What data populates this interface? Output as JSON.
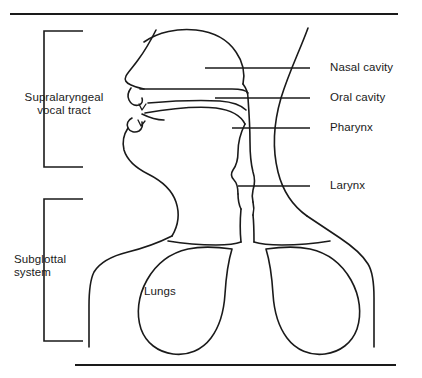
{
  "figure": {
    "background_color": "#ffffff",
    "line_color": "#1a1a1a"
  },
  "rules": {
    "top_rule_label": "top-divider-rule",
    "bottom_rule_label": "bottom-divider-rule"
  },
  "brackets": [
    {
      "id": "supralaryngeal",
      "label_line1": "Supralaryngeal",
      "label_line2": "vocal tract"
    },
    {
      "id": "subglottal",
      "label_line1": "Subglottal",
      "label_line2": "system"
    }
  ],
  "labels": {
    "supralaryngeal_vocal_tract": "Supralaryngeal\nvocal tract",
    "supralaryngeal_line1": "Supralaryngeal",
    "supralaryngeal_line2": "vocal tract",
    "subglottal_line1": "Subglottal",
    "subglottal_line2": "system",
    "nasal_cavity": "Nasal cavity",
    "oral_cavity": "Oral cavity",
    "pharynx": "Pharynx",
    "larynx": "Larynx",
    "lungs": "Lungs"
  },
  "annotations": [
    {
      "name": "nasal-cavity",
      "text": "Nasal cavity",
      "leader_from_x": 205,
      "leader_to_x": 310,
      "leader_y": 68
    },
    {
      "name": "oral-cavity",
      "text": "Oral cavity",
      "leader_from_x": 215,
      "leader_to_x": 310,
      "leader_y": 98
    },
    {
      "name": "pharynx",
      "text": "Pharynx",
      "leader_from_x": 232,
      "leader_to_x": 310,
      "leader_y": 128
    },
    {
      "name": "larynx",
      "text": "Larynx",
      "leader_from_x": 238,
      "leader_to_x": 310,
      "leader_y": 186
    }
  ],
  "anatomy_parts": [
    "head-profile-outline",
    "nasal-cavity-chamber",
    "hard-palate",
    "soft-palate-velum",
    "tongue",
    "upper-lip",
    "lower-lip",
    "jaw",
    "pharynx-tube",
    "larynx",
    "trachea",
    "left-lung",
    "right-lung",
    "left-shoulder-torso",
    "right-shoulder-torso",
    "back-of-head-neck-curve"
  ]
}
